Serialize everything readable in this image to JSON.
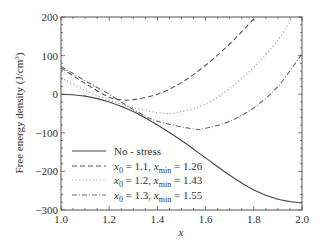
{
  "chart_data": {
    "type": "line",
    "title": "",
    "xlabel": "x",
    "ylabel": "Free energy density (J/cm³)",
    "xlim": [
      1.0,
      2.0
    ],
    "ylim": [
      -300,
      200
    ],
    "x_ticks": [
      1.0,
      1.2,
      1.4,
      1.6,
      1.8,
      2.0
    ],
    "x_tick_labels": [
      "1.0",
      "1.2",
      "1.4",
      "1.6",
      "1.8",
      "2.0"
    ],
    "y_ticks": [
      -300,
      -200,
      -100,
      0,
      100,
      200
    ],
    "y_tick_labels": [
      "−300",
      "−200",
      "−100",
      "0",
      "100",
      "200"
    ],
    "grid": false,
    "legend_position": "lower left",
    "series": [
      {
        "name": "No - stress",
        "legend_label": "No - stress",
        "style": "solid",
        "color": "#444444",
        "points": [
          [
            1.0,
            0
          ],
          [
            1.1,
            -5
          ],
          [
            1.2,
            -20
          ],
          [
            1.3,
            -45
          ],
          [
            1.4,
            -80
          ],
          [
            1.5,
            -120
          ],
          [
            1.6,
            -165
          ],
          [
            1.7,
            -210
          ],
          [
            1.8,
            -248
          ],
          [
            1.9,
            -272
          ],
          [
            2.0,
            -282
          ]
        ]
      },
      {
        "name": "x0 = 1.1, xmin = 1.26",
        "legend_label": "x₀ = 1.1, x_min = 1.26",
        "x0": 1.1,
        "xmin": 1.26,
        "style": "dashed",
        "color": "#555555",
        "points": [
          [
            1.0,
            68
          ],
          [
            1.1,
            28
          ],
          [
            1.2,
            -8
          ],
          [
            1.26,
            -15
          ],
          [
            1.3,
            -14
          ],
          [
            1.4,
            0
          ],
          [
            1.5,
            30
          ],
          [
            1.6,
            75
          ],
          [
            1.7,
            130
          ],
          [
            1.8,
            195
          ],
          [
            1.82,
            205
          ]
        ]
      },
      {
        "name": "x0 = 1.2, xmin = 1.43",
        "legend_label": "x₀ = 1.2, x_min = 1.43",
        "x0": 1.2,
        "xmin": 1.43,
        "style": "dotted",
        "color": "#999999",
        "points": [
          [
            1.0,
            42
          ],
          [
            1.1,
            10
          ],
          [
            1.2,
            -15
          ],
          [
            1.3,
            -35
          ],
          [
            1.43,
            -50
          ],
          [
            1.5,
            -45
          ],
          [
            1.6,
            -25
          ],
          [
            1.7,
            15
          ],
          [
            1.8,
            70
          ],
          [
            1.9,
            140
          ],
          [
            1.96,
            200
          ]
        ]
      },
      {
        "name": "x0 = 1.3, xmin = 1.55",
        "legend_label": "x₀ = 1.3, x_min = 1.55",
        "x0": 1.3,
        "xmin": 1.55,
        "style": "dashdot",
        "color": "#666666",
        "points": [
          [
            1.0,
            72
          ],
          [
            1.1,
            35
          ],
          [
            1.2,
            0
          ],
          [
            1.3,
            -40
          ],
          [
            1.4,
            -70
          ],
          [
            1.55,
            -90
          ],
          [
            1.6,
            -88
          ],
          [
            1.7,
            -70
          ],
          [
            1.8,
            -35
          ],
          [
            1.9,
            20
          ],
          [
            2.0,
            105
          ]
        ]
      }
    ]
  },
  "legend": {
    "items": [
      {
        "label": "No - stress",
        "sub_parts": null
      },
      {
        "x0_label": "x",
        "x0_sub": "0",
        "x0_value": " = 1.1, ",
        "xmin_label": "x",
        "xmin_sub": "min",
        "xmin_value": " = 1.26"
      },
      {
        "x0_label": "x",
        "x0_sub": "0",
        "x0_value": " = 1.2, ",
        "xmin_label": "x",
        "xmin_sub": "min",
        "xmin_value": " = 1.43"
      },
      {
        "x0_label": "x",
        "x0_sub": "0",
        "x0_value": " = 1.3, ",
        "xmin_label": "x",
        "xmin_sub": "min",
        "xmin_value": " = 1.55"
      }
    ]
  },
  "axes": {
    "xlabel": "x",
    "ylabel_main": "Free energy density (J/cm",
    "ylabel_sup": "3",
    "ylabel_end": ")"
  }
}
